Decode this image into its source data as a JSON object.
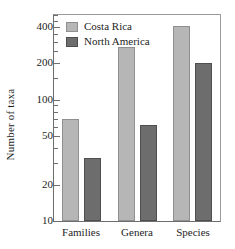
{
  "chart_data": {
    "type": "bar",
    "title": "",
    "xlabel": "",
    "ylabel": "Number of taxa",
    "categories": [
      "Families",
      "Genera",
      "Species"
    ],
    "series": [
      {
        "name": "Costa Rica",
        "color": "#b6b6b6",
        "values": [
          70,
          270,
          405
        ]
      },
      {
        "name": "North America",
        "color": "#6d6d6d",
        "values": [
          33,
          62,
          200
        ]
      }
    ],
    "yscale": "log",
    "ylim": [
      10,
      500
    ],
    "ytick_values": [
      10,
      20,
      50,
      100,
      200,
      400
    ],
    "ytick_labels": [
      "10",
      "20",
      "50",
      "100",
      "200",
      "400"
    ],
    "yminor_ticks": [
      30,
      40,
      60,
      70,
      80,
      90,
      150,
      250,
      300,
      350,
      450,
      500
    ],
    "grid": false,
    "legend_position": "top-left-inside",
    "legend": [
      {
        "label": "Costa Rica",
        "swatch": "#b6b6b6"
      },
      {
        "label": "North America",
        "swatch": "#6d6d6d"
      }
    ]
  },
  "figure": {
    "background_color": "#ffffff",
    "frame_color": "#6e6e6e",
    "text_color": "#1e1e1e"
  }
}
